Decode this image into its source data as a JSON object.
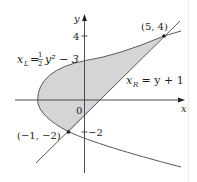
{
  "figure": {
    "type": "region-between-curves",
    "axes": {
      "x_label": "x",
      "y_label": "y",
      "origin_label": "0",
      "y_ticks": [
        {
          "value": 4,
          "label": "4"
        },
        {
          "value": -2,
          "label": "−2"
        }
      ]
    },
    "curves": {
      "left": {
        "name": "x_L",
        "label_main": "x",
        "label_sub": "L",
        "label_eq": "= ",
        "label_frac_num": "1",
        "label_frac_den": "2",
        "label_rest": "y² − 3",
        "equation": "x_L = (1/2)y^2 - 3"
      },
      "right": {
        "name": "x_R",
        "label_main": "x",
        "label_sub": "R",
        "label_rest": " = y + 1",
        "equation": "x_R = y + 1"
      }
    },
    "points": [
      {
        "label": "(5, 4)",
        "x": 5,
        "y": 4
      },
      {
        "label": "(−1, −2)",
        "x": -1,
        "y": -2
      }
    ],
    "colors": {
      "shade": "#d4d5d7",
      "line": "#58595b",
      "axis": "#3a3a3a",
      "text": "#231f20"
    }
  }
}
